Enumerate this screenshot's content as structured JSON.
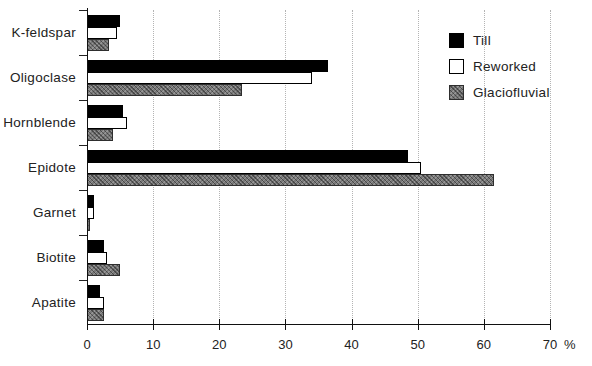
{
  "chart_data": {
    "type": "bar",
    "orientation": "horizontal",
    "title": "",
    "xlabel": "%",
    "ylabel": "",
    "xlim": [
      0,
      70
    ],
    "x_ticks": [
      0,
      10,
      20,
      30,
      40,
      50,
      60,
      70
    ],
    "grid": "vertical-dotted",
    "legend_position": "upper-right",
    "categories": [
      "K-feldspar",
      "Oligoclase",
      "Hornblende",
      "Epidote",
      "Garnet",
      "Biotite",
      "Apatite"
    ],
    "series": [
      {
        "name": "Till",
        "style": "black",
        "color": "#000000",
        "values": [
          5,
          36.5,
          5.5,
          48.5,
          1,
          2.5,
          2
        ]
      },
      {
        "name": "Reworked",
        "style": "white",
        "color": "#ffffff",
        "values": [
          4.5,
          34,
          6,
          50.5,
          1,
          3,
          2.5
        ]
      },
      {
        "name": "Glaciofluvial",
        "style": "gray",
        "color": "#787878",
        "values": [
          3.3,
          23.5,
          4,
          61.5,
          0.5,
          5,
          2.5
        ]
      }
    ]
  }
}
